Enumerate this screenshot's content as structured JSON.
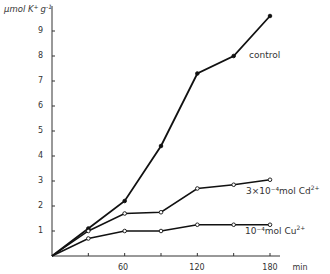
{
  "chart_data": {
    "type": "line",
    "title": "",
    "xlabel": "min",
    "ylabel": "μmol K⁺ g⁻¹",
    "x": [
      0,
      30,
      60,
      90,
      120,
      150,
      180
    ],
    "x_ticks": [
      60,
      120,
      180
    ],
    "x_minor_ticks": [
      30,
      90,
      150
    ],
    "y_ticks": [
      1,
      2,
      3,
      4,
      5,
      6,
      7,
      8,
      9
    ],
    "xlim": [
      0,
      195
    ],
    "ylim": [
      0,
      10
    ],
    "grid": false,
    "legend": "inline labels at line ends",
    "series": [
      {
        "name": "control",
        "label": "control",
        "marker": "filled-circle",
        "values": [
          0,
          1.1,
          2.2,
          4.4,
          7.3,
          8.0,
          9.6
        ]
      },
      {
        "name": "3×10⁻⁴ mol Cd²⁺",
        "label_main": "3×10⁻⁴mol Cd",
        "label_sup": "2+",
        "marker": "open-circle",
        "values": [
          0,
          1.0,
          1.7,
          1.75,
          2.7,
          2.85,
          3.05
        ]
      },
      {
        "name": "10⁻⁴ mol Cu²⁺",
        "label_main": "10⁻⁴mol Cu",
        "label_sup": "2+",
        "marker": "open-circle",
        "values": [
          0,
          0.7,
          1.0,
          1.0,
          1.25,
          1.25,
          1.25
        ]
      }
    ]
  },
  "labels": {
    "ylabel_main": "μmol K",
    "ylabel_sup1": "+",
    "ylabel_g": "g",
    "ylabel_sup2": "-1",
    "xlabel": "min",
    "x_tick_60": "60",
    "x_tick_120": "120",
    "x_tick_180": "180",
    "y_tick_1": "1",
    "y_tick_2": "2",
    "y_tick_3": "3",
    "y_tick_4": "4",
    "y_tick_5": "5",
    "y_tick_6": "6",
    "y_tick_7": "7",
    "y_tick_8": "8",
    "y_tick_9": "9",
    "control": "control",
    "cd_main": "3×10⁻⁴mol  Cd",
    "cd_sup": "2+",
    "cu_main": "10⁻⁴mol  Cu",
    "cu_sup": "2+"
  }
}
